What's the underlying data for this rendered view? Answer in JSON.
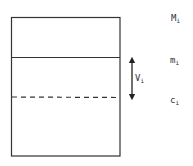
{
  "diagram": {
    "labels": {
      "top": {
        "main": "M",
        "sub": "i"
      },
      "middle": {
        "main": "m",
        "sub": "i"
      },
      "arrow": {
        "main": "V",
        "sub": "i"
      },
      "bottom": {
        "main": "c",
        "sub": "i"
      }
    },
    "colors": {
      "stroke": "#333333",
      "background": "#ffffff"
    }
  }
}
